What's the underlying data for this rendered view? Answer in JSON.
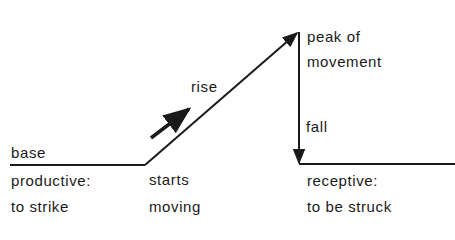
{
  "diagram": {
    "labels": {
      "base": "base",
      "productive_line1": "productive:",
      "productive_line2": "to strike",
      "starts_line1": "starts",
      "starts_line2": "moving",
      "rise": "rise",
      "peak_line1": "peak of",
      "peak_line2": "movement",
      "fall": "fall",
      "receptive_line1": "receptive:",
      "receptive_line2": "to be struck"
    },
    "colors": {
      "line": "#1a1a1a",
      "background": "#ffffff"
    }
  }
}
